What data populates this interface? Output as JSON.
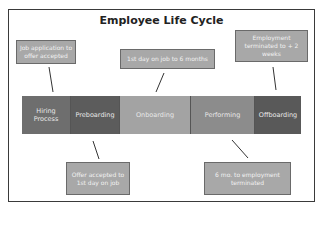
{
  "title": "Employee Life Cycle",
  "stages": [
    {
      "label": "Hiring Process",
      "color": "#6e6e6e"
    },
    {
      "label": "Preboarding",
      "color": "#5c5c5c"
    },
    {
      "label": "Onboarding",
      "color": "#a3a3a3"
    },
    {
      "label": "Performing",
      "color": "#8c8c8c"
    },
    {
      "label": "Offboarding",
      "color": "#595959"
    }
  ],
  "callouts": {
    "hiring": "Job application to offer accepted",
    "onboarding": "1st day on job to 6 months",
    "offboarding": "Employment terminated to + 2 weeks",
    "preboarding": "Offer accepted to 1st day on job",
    "performing": "6 mo. to employment terminated"
  },
  "colors": {
    "callout_fill": "#a8a8a8",
    "frame": "#3a3a3a"
  }
}
